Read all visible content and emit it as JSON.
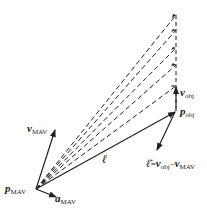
{
  "diagram": {
    "type": "vector-geometry",
    "colors": {
      "line": "#222222",
      "background": "#ffffff"
    },
    "points": {
      "p_mav": {
        "x": 36,
        "y": 189,
        "label": "p",
        "sub": "MAV"
      },
      "p_obj": {
        "x": 176,
        "y": 111,
        "label": "p",
        "sub": "obj"
      }
    },
    "labels": {
      "v_mav": {
        "main": "v",
        "sub": "MAV"
      },
      "a_mav": {
        "main": "a",
        "sub": "MAV"
      },
      "v_obj": {
        "main": "v",
        "sub": "obj"
      },
      "ell": {
        "main": "ℓ"
      },
      "ell_dot": {
        "main": "ℓ̇",
        "eq": "=",
        "v1": "v",
        "v1_sub": "obj",
        "minus": "−",
        "v2": "v",
        "v2_sub": "MAV"
      }
    },
    "dashed_targets_y": [
      15,
      30,
      48,
      65,
      86
    ]
  }
}
